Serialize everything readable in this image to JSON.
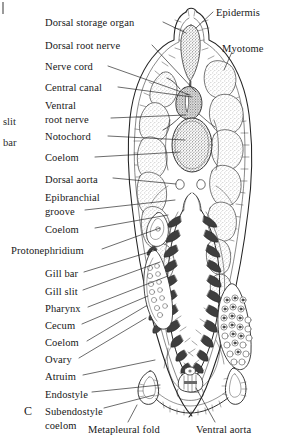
{
  "figure": {
    "mark": "C",
    "caption_organism": "Amphioxus cross section through pharynx",
    "ink_color": "#1a1a1a",
    "paper_color": "#ffffff",
    "stipple_color": "#6e6e6e",
    "dark_tissue_color": "#5a5a5a"
  },
  "edge_fragments": [
    {
      "label": "slit",
      "x": 3,
      "y": 116
    },
    {
      "label": "bar",
      "x": 3,
      "y": 137
    }
  ],
  "labels_left": [
    {
      "id": "dorsal-storage-organ",
      "text": "Dorsal storage organ",
      "x": 45,
      "y": 17,
      "leader": [
        [
          163,
          22
        ],
        [
          186,
          33
        ]
      ]
    },
    {
      "id": "dorsal-root-nerve",
      "text": "Dorsal root nerve",
      "x": 45,
      "y": 40,
      "leader": [
        [
          152,
          45
        ],
        [
          196,
          92
        ]
      ]
    },
    {
      "id": "nerve-cord",
      "text": "Nerve cord",
      "x": 45,
      "y": 61,
      "leader": [
        [
          108,
          66
        ],
        [
          190,
          95
        ]
      ]
    },
    {
      "id": "central-canal",
      "text": "Central canal",
      "x": 45,
      "y": 82,
      "leader": [
        [
          118,
          87
        ],
        [
          192,
          97
        ]
      ]
    },
    {
      "id": "ventral",
      "text": "Ventral",
      "x": 45,
      "y": 100,
      "leader": null
    },
    {
      "id": "ventral-root-nerve",
      "text": "root nerve",
      "x": 45,
      "y": 114,
      "leader": [
        [
          111,
          118
        ],
        [
          186,
          115
        ]
      ]
    },
    {
      "id": "notochord",
      "text": "Notochord",
      "x": 45,
      "y": 131,
      "leader": [
        [
          108,
          136
        ],
        [
          185,
          140
        ]
      ]
    },
    {
      "id": "coelom-dorsal",
      "text": "Coelom",
      "x": 45,
      "y": 152,
      "leader": [
        [
          95,
          157
        ],
        [
          180,
          152
        ]
      ]
    },
    {
      "id": "dorsal-aorta",
      "text": "Dorsal aorta",
      "x": 45,
      "y": 174,
      "leader": [
        [
          113,
          178
        ],
        [
          176,
          184
        ]
      ]
    },
    {
      "id": "epibranchial",
      "text": "Epibranchial",
      "x": 45,
      "y": 192,
      "leader": null
    },
    {
      "id": "epibranchial-groove",
      "text": "groove",
      "x": 45,
      "y": 206,
      "leader": [
        [
          85,
          210
        ],
        [
          175,
          200
        ]
      ]
    },
    {
      "id": "coelom-mid",
      "text": "Coelom",
      "x": 45,
      "y": 224,
      "leader": [
        [
          95,
          228
        ],
        [
          168,
          215
        ]
      ]
    },
    {
      "id": "protonephridium",
      "text": "Protonephridium",
      "x": 11,
      "y": 245,
      "leader": [
        [
          102,
          249
        ],
        [
          160,
          228
        ]
      ]
    },
    {
      "id": "gill-bar",
      "text": "Gill bar",
      "x": 45,
      "y": 268,
      "leader": [
        [
          84,
          272
        ],
        [
          156,
          250
        ]
      ]
    },
    {
      "id": "gill-slit",
      "text": "Gill slit",
      "x": 45,
      "y": 286,
      "leader": [
        [
          83,
          290
        ],
        [
          160,
          262
        ]
      ]
    },
    {
      "id": "pharynx",
      "text": "Pharynx",
      "x": 45,
      "y": 303,
      "leader": [
        [
          88,
          307
        ],
        [
          168,
          276
        ]
      ]
    },
    {
      "id": "cecum",
      "text": "Cecum",
      "x": 45,
      "y": 320,
      "leader": [
        [
          82,
          324
        ],
        [
          148,
          296
        ]
      ]
    },
    {
      "id": "coelom-ventral",
      "text": "Coelom",
      "x": 45,
      "y": 337,
      "leader": [
        [
          87,
          341
        ],
        [
          146,
          306
        ]
      ]
    },
    {
      "id": "ovary",
      "text": "Ovary",
      "x": 45,
      "y": 354,
      "leader": [
        [
          79,
          358
        ],
        [
          146,
          318
        ]
      ]
    },
    {
      "id": "atrium",
      "text": "Atruim",
      "x": 45,
      "y": 371,
      "leader": [
        [
          83,
          375
        ],
        [
          155,
          360
        ]
      ]
    },
    {
      "id": "endostyle",
      "text": "Endostyle",
      "x": 45,
      "y": 389,
      "leader": [
        [
          92,
          392
        ],
        [
          160,
          385
        ]
      ]
    },
    {
      "id": "subendostyle",
      "text": "Subendostyle",
      "x": 45,
      "y": 406,
      "leader": null
    },
    {
      "id": "subendostyle-coelom",
      "text": "coelom",
      "x": 45,
      "y": 420,
      "leader": [
        [
          104,
          408
        ],
        [
          154,
          395
        ]
      ]
    }
  ],
  "labels_right": [
    {
      "id": "epidermis",
      "text": "Epidermis",
      "x": 216,
      "y": 7,
      "leader": [
        [
          213,
          12
        ],
        [
          196,
          28
        ]
      ]
    },
    {
      "id": "myotome",
      "text": "Myotome",
      "x": 222,
      "y": 43,
      "leader": [
        [
          232,
          52
        ],
        [
          224,
          70
        ]
      ]
    }
  ],
  "labels_bottom": [
    {
      "id": "metapleural-fold",
      "text": "Metapleural fold",
      "x": 88,
      "y": 424,
      "leader": [
        [
          128,
          422
        ],
        [
          137,
          405
        ]
      ]
    },
    {
      "id": "ventral-aorta",
      "text": "Ventral aorta",
      "x": 196,
      "y": 424,
      "leader": [
        [
          215,
          422
        ],
        [
          196,
          388
        ]
      ]
    }
  ]
}
